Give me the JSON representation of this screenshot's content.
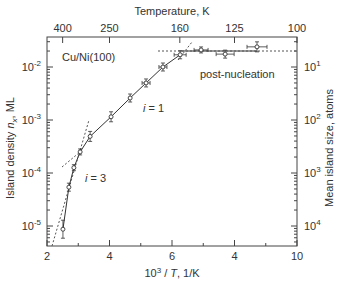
{
  "chart_data": {
    "type": "scatter",
    "title": "",
    "annotation_material": "Cu/Ni(100)",
    "xlabel": "10^3 / T, 1/K",
    "xlabel_parts": {
      "base": "10",
      "sup": "3",
      "mid": " / ",
      "var": "T",
      "unit": ", 1/K"
    },
    "ylabel": "Island density n_x, ML",
    "ylabel_parts": {
      "text": "Island density ",
      "var": "n",
      "sub": "x",
      "unit": ", ML"
    },
    "top_label": "Temperature, K",
    "right_label": "Mean island size, atoms",
    "xlim": [
      2,
      10
    ],
    "ylim_log": [
      1e-05,
      0.04
    ],
    "x_ticks": [
      {
        "value": 2,
        "label": "2"
      },
      {
        "value": 4,
        "label": "4"
      },
      {
        "value": 6,
        "label": "6"
      },
      {
        "value": 8,
        "label": "4"
      },
      {
        "value": 10,
        "label": "10"
      }
    ],
    "top_ticks": [
      {
        "value": 2.5,
        "label": "400"
      },
      {
        "value": 4,
        "label": "250"
      },
      {
        "value": 6.25,
        "label": "160"
      },
      {
        "value": 8,
        "label": "125"
      },
      {
        "value": 10,
        "label": "100"
      }
    ],
    "y_ticks": [
      {
        "exp": -2,
        "base": "10",
        "sup": "-2"
      },
      {
        "exp": -3,
        "base": "10",
        "sup": "-3"
      },
      {
        "exp": -4,
        "base": "10",
        "sup": "-4"
      },
      {
        "exp": -5,
        "base": "10",
        "sup": "-5"
      }
    ],
    "right_ticks": [
      {
        "exp": -2,
        "base": "10",
        "sup": "1"
      },
      {
        "exp": -3,
        "base": "10",
        "sup": "2"
      },
      {
        "exp": -4,
        "base": "10",
        "sup": "3"
      },
      {
        "exp": -5,
        "base": "10",
        "sup": "4"
      }
    ],
    "series": [
      {
        "name": "Island density",
        "x": [
          2.51,
          2.7,
          2.86,
          3.06,
          3.38,
          4.05,
          4.66,
          5.17,
          5.71,
          6.26,
          6.93,
          7.7,
          8.72
        ],
        "y": [
          8.7e-06,
          5.4e-05,
          0.000126,
          0.00025,
          0.00049,
          0.00115,
          0.0026,
          0.005,
          0.01,
          0.017,
          0.021,
          0.0175,
          0.024
        ]
      }
    ],
    "annotations": [
      {
        "text": "i = 3",
        "var": "i",
        "rest": " = 3"
      },
      {
        "text": "i = 1",
        "var": "i",
        "rest": " = 1"
      },
      {
        "text": "post-nucleation"
      }
    ],
    "grid": false,
    "legend": "none"
  }
}
